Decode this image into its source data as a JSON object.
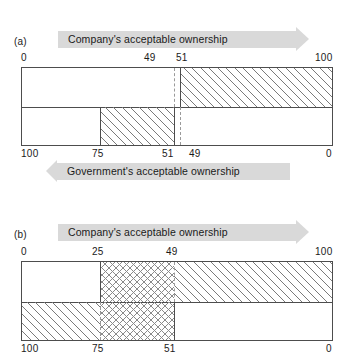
{
  "figure": {
    "panels": [
      {
        "id": "a",
        "label": "(a)",
        "company_banner": "Company's acceptable ownership",
        "government_banner": "Government's acceptable ownership",
        "top_axis": {
          "ticks": [
            {
              "value": "0",
              "pos": 0
            },
            {
              "value": "49",
              "pos": 49
            },
            {
              "value": "51",
              "pos": 51
            },
            {
              "value": "100",
              "pos": 100
            }
          ]
        },
        "bottom_axis": {
          "ticks": [
            {
              "value": "100",
              "pos": 0
            },
            {
              "value": "75",
              "pos": 25
            },
            {
              "value": "51",
              "pos": 49
            },
            {
              "value": "49",
              "pos": 51
            },
            {
              "value": "0",
              "pos": 100
            }
          ]
        },
        "top_row": {
          "fill_start": 51,
          "fill_end": 100,
          "fill_style": "hatch",
          "solid_edge": 51,
          "dashed_edge": 49
        },
        "bottom_row": {
          "fill_start": 25,
          "fill_end": 49,
          "fill_style": "hatch",
          "solid_edge_left": 25,
          "solid_edge_right": 49,
          "dashed_edge": 51
        }
      },
      {
        "id": "b",
        "label": "(b)",
        "company_banner": "Company's acceptable ownership",
        "government_banner": "",
        "top_axis": {
          "ticks": [
            {
              "value": "0",
              "pos": 0
            },
            {
              "value": "25",
              "pos": 25
            },
            {
              "value": "49",
              "pos": 49
            },
            {
              "value": "100",
              "pos": 100
            }
          ]
        },
        "bottom_axis": {
          "ticks": [
            {
              "value": "100",
              "pos": 0
            },
            {
              "value": "75",
              "pos": 25
            },
            {
              "value": "51",
              "pos": 49
            },
            {
              "value": "0",
              "pos": 100
            }
          ]
        },
        "top_row": {
          "cross_start": 25,
          "cross_end": 49,
          "hatch_start": 49,
          "hatch_end": 100,
          "solid_edge": 25,
          "dashed_edge": 49
        },
        "bottom_row": {
          "hatch_start": 0,
          "hatch_end": 25,
          "cross_start": 25,
          "cross_end": 49,
          "solid_edge": 49,
          "dashed_edge": 25
        }
      }
    ],
    "colors": {
      "banner_fill": "#d9d9d9",
      "line": "#4d4d4d",
      "hatch": "#7a7a7a",
      "dashed": "#9a9a9a"
    }
  }
}
